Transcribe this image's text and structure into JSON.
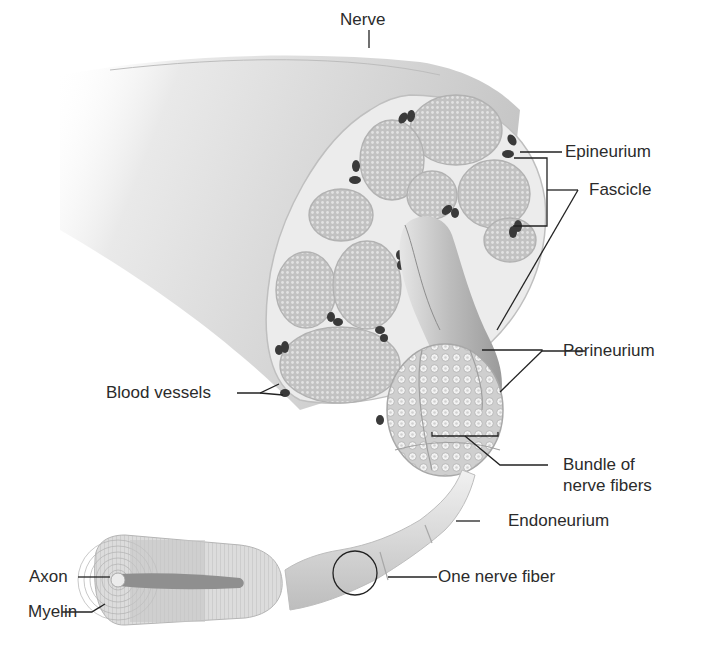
{
  "diagram": {
    "labels": {
      "nerve": "Nerve",
      "epineurium": "Epineurium",
      "fascicle": "Fascicle",
      "perineurium": "Perineurium",
      "blood_vessels": "Blood vessels",
      "bundle_line1": "Bundle of",
      "bundle_line2": "nerve fibers",
      "endoneurium": "Endoneurium",
      "one_nerve_fiber": "One nerve fiber",
      "axon": "Axon",
      "myelin": "Myelin"
    },
    "colors": {
      "background": "#ffffff",
      "nerve_body": "#d9d9d9",
      "fascicle_fill": "#bdbdbd",
      "epineurium_fill": "#e8e8e8",
      "blood_vessel": "#3a3a3a",
      "leader_line": "#222222",
      "text": "#2b2b2b"
    }
  }
}
